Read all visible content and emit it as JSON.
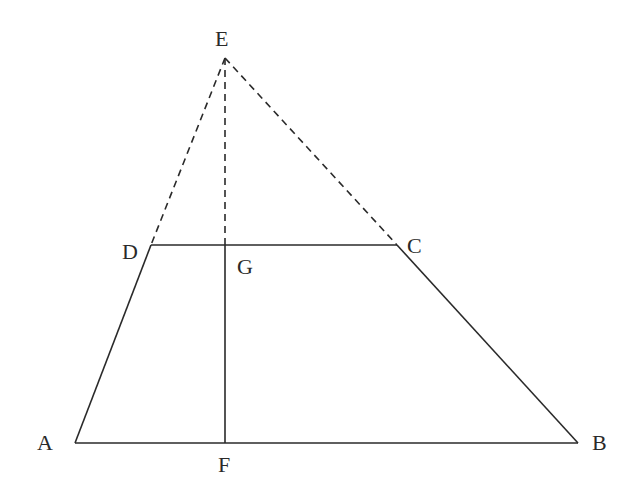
{
  "diagram": {
    "type": "geometry",
    "points": {
      "E": {
        "label": "E",
        "x": 225,
        "y": 58
      },
      "D": {
        "label": "D",
        "x": 151,
        "y": 245
      },
      "C": {
        "label": "C",
        "x": 397,
        "y": 245
      },
      "G": {
        "label": "G",
        "x": 225,
        "y": 245
      },
      "A": {
        "label": "A",
        "x": 75,
        "y": 443
      },
      "B": {
        "label": "B",
        "x": 578,
        "y": 443
      },
      "F": {
        "label": "F",
        "x": 225,
        "y": 443
      }
    },
    "segments": {
      "solid": [
        "AB",
        "DC",
        "AD",
        "CB",
        "GF"
      ],
      "dashed": [
        "ED",
        "EC",
        "EG"
      ]
    }
  }
}
